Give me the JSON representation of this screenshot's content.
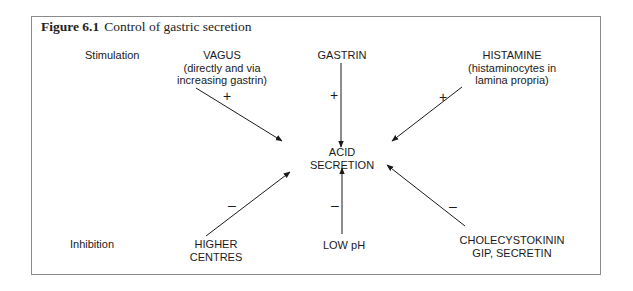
{
  "figure": {
    "number": "Figure 6.1",
    "caption": "Control of gastric secretion"
  },
  "rows": {
    "stimulation_label": "Stimulation",
    "inhibition_label": "Inhibition"
  },
  "center": {
    "line1": "ACID",
    "line2": "SECRETION"
  },
  "stimulators": [
    {
      "name": "VAGUS",
      "line2": "(directly and via",
      "line3": "increasing gastrin)",
      "sign": "+"
    },
    {
      "name": "GASTRIN",
      "sign": "+"
    },
    {
      "name": "HISTAMINE",
      "line2": "(histaminocytes in",
      "line3": "lamina propria)",
      "sign": "+"
    }
  ],
  "inhibitors": [
    {
      "line1": "HIGHER",
      "line2": "CENTRES",
      "sign": "–"
    },
    {
      "line1": "LOW pH",
      "sign": "–"
    },
    {
      "line1": "CHOLECYSTOKININ",
      "line2": "GIP, SECRETIN",
      "sign": "–"
    }
  ],
  "colors": {
    "frame": "#8a8a8a",
    "ink": "#1a1a1a"
  }
}
